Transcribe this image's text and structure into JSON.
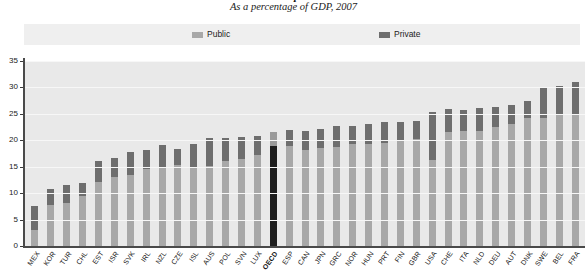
{
  "header": {
    "title": "Health expenditure",
    "subtitle": "As a percentage of GDP, 2007"
  },
  "legend": {
    "position": "top",
    "items": [
      {
        "label": "Public",
        "color": "#a8a8a8"
      },
      {
        "label": "Private",
        "color": "#6e6e6e"
      }
    ]
  },
  "colors": {
    "public": "#a8a8a8",
    "private": "#6e6e6e",
    "highlight_public": "#9a9a9a",
    "highlight_private": "#1e1e1e",
    "plot_background": "#e9e9e9",
    "legend_background": "#efefef",
    "axis": "#4a4a4a",
    "gridline": "#f7f7f7"
  },
  "yaxis": {
    "ticks": [
      "0",
      "5",
      "10",
      "15",
      "20",
      "25",
      "30",
      "35"
    ],
    "min": 0,
    "max": 35
  },
  "chart_data": {
    "type": "bar",
    "title": "Health expenditure",
    "subtitle": "As a percentage of GDP, 2007",
    "xlabel": "",
    "ylabel": "",
    "ylim": [
      0,
      35
    ],
    "ytick_step": 5,
    "grid": true,
    "stacked": true,
    "legend_position": "top",
    "highlight_category": "OECD",
    "categories": [
      "MEX",
      "KOR",
      "TUR",
      "CHL",
      "EST",
      "ISR",
      "SVK",
      "IRL",
      "NZL",
      "CZE",
      "ISL",
      "AUS",
      "POL",
      "SVN",
      "LUX",
      "OECD",
      "ESP",
      "CAN",
      "JPN",
      "GRC",
      "NOR",
      "HUN",
      "PRT",
      "FIN",
      "GBR",
      "USA",
      "CHE",
      "ITA",
      "NLD",
      "DEU",
      "AUT",
      "DNK",
      "SWE",
      "BEL",
      "FRA"
    ],
    "series": [
      {
        "name": "Public",
        "color": "#a8a8a8",
        "values": [
          3.1,
          7.7,
          8.2,
          9.5,
          12.2,
          13.0,
          13.5,
          14.5,
          14.9,
          15.4,
          15.0,
          15.2,
          16.1,
          16.5,
          17.2,
          18.9,
          18.9,
          18.1,
          18.6,
          18.7,
          19.3,
          19.3,
          19.5,
          20.0,
          20.3,
          16.2,
          21.5,
          21.8,
          21.8,
          22.5,
          23.0,
          24.2,
          24.3,
          24.8,
          25.0
        ]
      },
      {
        "name": "Private",
        "color": "#6e6e6e",
        "values": [
          4.4,
          3.0,
          3.3,
          2.5,
          3.8,
          3.6,
          4.2,
          3.6,
          4.2,
          3.0,
          4.3,
          5.3,
          4.4,
          4.2,
          3.6,
          2.7,
          3.0,
          3.7,
          3.5,
          4.1,
          3.5,
          3.8,
          4.0,
          3.5,
          3.4,
          9.1,
          4.5,
          4.0,
          4.4,
          3.8,
          3.7,
          3.2,
          5.7,
          5.4,
          6.0
        ]
      }
    ],
    "totals": [
      7.5,
      10.7,
      11.5,
      12.0,
      16.0,
      16.6,
      17.7,
      18.1,
      19.1,
      18.4,
      19.3,
      20.5,
      20.5,
      20.7,
      20.8,
      21.6,
      21.9,
      21.8,
      22.1,
      22.8,
      22.8,
      23.1,
      23.5,
      23.5,
      23.7,
      25.3,
      26.0,
      25.8,
      26.2,
      26.3,
      26.7,
      27.4,
      30.0,
      30.2,
      31.0
    ]
  }
}
